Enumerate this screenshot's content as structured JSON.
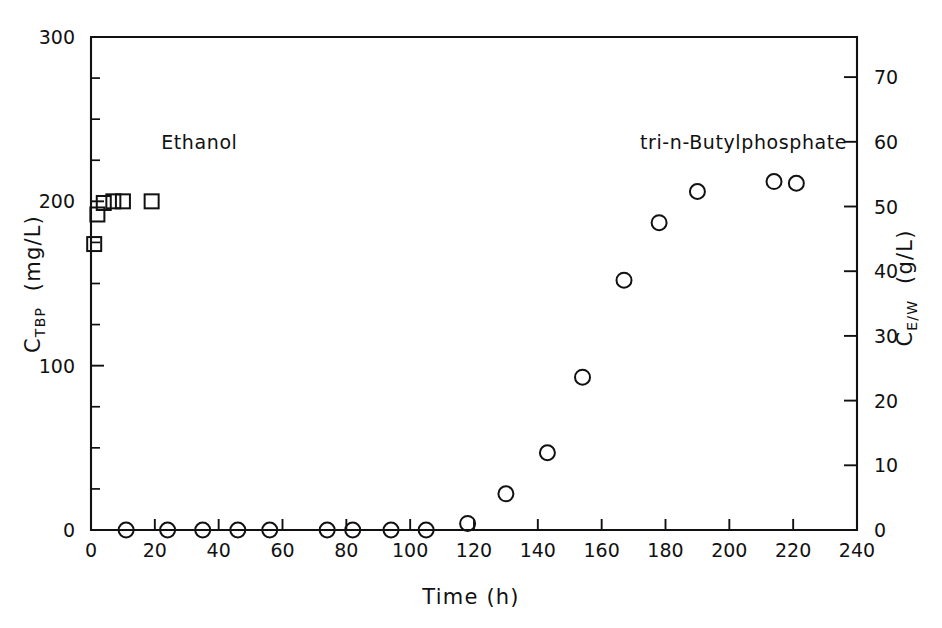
{
  "chart_data": {
    "type": "scatter",
    "title": "",
    "xlabel": "Time  (h)",
    "ylabel": "CTBP  (mg/L)",
    "ylabel_main": "C",
    "ylabel_sub": "TBP",
    "ylabel_units": "(mg/L)",
    "y2label": "CE/W  (g/L)",
    "y2label_main": "C",
    "y2label_sub": "E/W",
    "y2label_units": "(g/L)",
    "xlim": [
      0,
      240
    ],
    "ylim": [
      0,
      300
    ],
    "y2lim": [
      0,
      76.2
    ],
    "xticks": [
      0,
      20,
      40,
      60,
      80,
      100,
      120,
      140,
      160,
      180,
      200,
      220,
      240
    ],
    "xticklabels": [
      "0",
      "20",
      "40",
      "60",
      "80",
      "100",
      "120",
      "140",
      "160",
      "180",
      "200",
      "220",
      "240"
    ],
    "yticks": [
      0,
      100,
      200,
      300
    ],
    "yticklabels": [
      "0",
      "100",
      "200",
      "300"
    ],
    "yticks_minor": [
      25,
      50,
      75,
      125,
      150,
      175,
      225,
      250,
      275
    ],
    "y2ticks": [
      0,
      10,
      20,
      30,
      40,
      50,
      60,
      70
    ],
    "y2ticklabels": [
      "0",
      "10",
      "20",
      "30",
      "40",
      "50",
      "60",
      "70"
    ],
    "grid": false,
    "legend_position": "in-plot-annotations",
    "series": [
      {
        "name": "Ethanol",
        "marker": "square",
        "axis": "right",
        "annotation": "Ethanol",
        "annotation_x": 22,
        "annotation_y": 232,
        "points": [
          {
            "x": 1,
            "y": 174
          },
          {
            "x": 2,
            "y": 192
          },
          {
            "x": 4,
            "y": 199
          },
          {
            "x": 7,
            "y": 200
          },
          {
            "x": 10,
            "y": 200
          },
          {
            "x": 19,
            "y": 200
          }
        ]
      },
      {
        "name": "tri-n-Butylphosphate",
        "marker": "circle",
        "axis": "left",
        "annotation": "tri-n-Butylphosphate",
        "annotation_x": 172,
        "annotation_y": 232,
        "points": [
          {
            "x": 11,
            "y": 0
          },
          {
            "x": 24,
            "y": 0
          },
          {
            "x": 35,
            "y": 0
          },
          {
            "x": 46,
            "y": 0
          },
          {
            "x": 56,
            "y": 0
          },
          {
            "x": 74,
            "y": 0
          },
          {
            "x": 82,
            "y": 0
          },
          {
            "x": 94,
            "y": 0
          },
          {
            "x": 105,
            "y": 0
          },
          {
            "x": 118,
            "y": 4
          },
          {
            "x": 130,
            "y": 22
          },
          {
            "x": 143,
            "y": 47
          },
          {
            "x": 154,
            "y": 93
          },
          {
            "x": 167,
            "y": 152
          },
          {
            "x": 178,
            "y": 187
          },
          {
            "x": 190,
            "y": 206
          },
          {
            "x": 214,
            "y": 212
          },
          {
            "x": 221,
            "y": 211
          }
        ]
      }
    ]
  }
}
